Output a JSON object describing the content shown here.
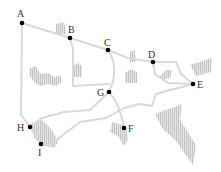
{
  "diagram": {
    "type": "map-graph",
    "colors": {
      "road": "#d9d9d9",
      "region": "#c8c8c8",
      "node": "#000000",
      "label": "#333333"
    },
    "nodes": [
      {
        "id": "A",
        "label": "A",
        "x": 22,
        "y": 23
      },
      {
        "id": "B",
        "label": "B",
        "x": 70,
        "y": 38
      },
      {
        "id": "C",
        "label": "C",
        "x": 108,
        "y": 50
      },
      {
        "id": "D",
        "label": "D",
        "x": 153,
        "y": 62
      },
      {
        "id": "E",
        "label": "E",
        "x": 193,
        "y": 84
      },
      {
        "id": "F",
        "label": "F",
        "x": 124,
        "y": 128
      },
      {
        "id": "G",
        "label": "G",
        "x": 109,
        "y": 92
      },
      {
        "id": "H",
        "label": "H",
        "x": 30,
        "y": 127
      },
      {
        "id": "I",
        "label": "I",
        "x": 41,
        "y": 144
      }
    ],
    "edges": [
      [
        "A",
        "B"
      ],
      [
        "B",
        "C"
      ],
      [
        "C",
        "D"
      ],
      [
        "D",
        "E"
      ],
      [
        "A",
        "H"
      ],
      [
        "C",
        "G"
      ],
      [
        "G",
        "F"
      ],
      [
        "H",
        "I"
      ],
      [
        "B",
        "G"
      ],
      [
        "I",
        "E"
      ]
    ]
  }
}
